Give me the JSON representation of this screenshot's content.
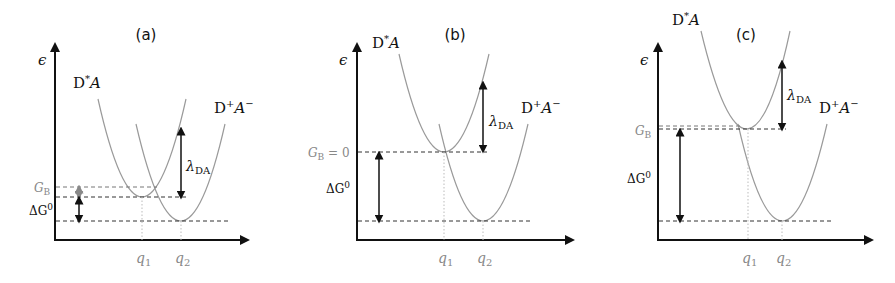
{
  "figure": {
    "panels": [
      {
        "id": "a",
        "label": "(a)",
        "y_axis_label": "ϵ",
        "reactant_state": {
          "base": "D",
          "sup": "*",
          "italic": "A"
        },
        "product_state": {
          "base": "D",
          "sup": "+",
          "italic": "A",
          "italic_sup": "−"
        },
        "barrier_label": {
          "main": "G",
          "sub": "B"
        },
        "driving_force_label": {
          "main": "ΔG",
          "sup": "0"
        },
        "reorg_label": {
          "main": "λ",
          "sub": "DA"
        },
        "q1_label": {
          "main": "q",
          "sub": "1"
        },
        "q2_label": {
          "main": "q",
          "sub": "2"
        },
        "regime": "normal"
      },
      {
        "id": "b",
        "label": "(b)",
        "y_axis_label": "ϵ",
        "reactant_state": {
          "base": "D",
          "sup": "*",
          "italic": "A"
        },
        "product_state": {
          "base": "D",
          "sup": "+",
          "italic": "A",
          "italic_sup": "−"
        },
        "barrier_label": {
          "main": "G",
          "sub": "B",
          "suffix": " = 0"
        },
        "driving_force_label": {
          "main": "ΔG",
          "sup": "0"
        },
        "reorg_label": {
          "main": "λ",
          "sub": "DA"
        },
        "q1_label": {
          "main": "q",
          "sub": "1"
        },
        "q2_label": {
          "main": "q",
          "sub": "2"
        },
        "regime": "activationless"
      },
      {
        "id": "c",
        "label": "(c)",
        "y_axis_label": "ϵ",
        "reactant_state": {
          "base": "D",
          "sup": "*",
          "italic": "A"
        },
        "product_state": {
          "base": "D",
          "sup": "+",
          "italic": "A",
          "italic_sup": "−"
        },
        "barrier_label": {
          "main": "G",
          "sub": "B"
        },
        "driving_force_label": {
          "main": "ΔG",
          "sup": "0"
        },
        "reorg_label": {
          "main": "λ",
          "sub": "DA"
        },
        "q1_label": {
          "main": "q",
          "sub": "1"
        },
        "q2_label": {
          "main": "q",
          "sub": "2"
        },
        "regime": "inverted"
      }
    ]
  },
  "colors": {
    "axis": "#111111",
    "curve": "#9a9a9a",
    "muted_label": "#888888",
    "background": "#ffffff"
  }
}
